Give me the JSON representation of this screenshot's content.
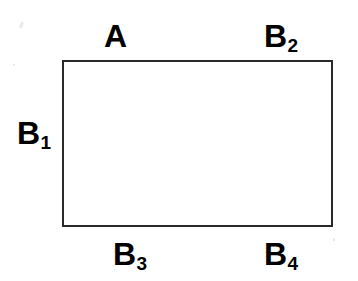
{
  "figure": {
    "type": "geometry-diagram",
    "background_color": "#ffffff",
    "shape": {
      "name": "rectangle",
      "fill_color": "#ffffff",
      "stroke_color": "#2a2a2a",
      "stroke_width": 2
    },
    "labels": {
      "top_left": {
        "base": "A",
        "subscript": ""
      },
      "top_right": {
        "base": "B",
        "subscript": "2"
      },
      "left": {
        "base": "B",
        "subscript": "1"
      },
      "bottom_left": {
        "base": "B",
        "subscript": "3"
      },
      "bottom_right": {
        "base": "B",
        "subscript": "4"
      }
    }
  }
}
